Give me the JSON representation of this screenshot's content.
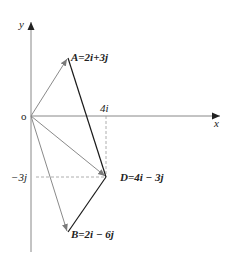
{
  "diagram": {
    "axes": {
      "x_label": "x",
      "y_label": "y",
      "origin_label": "o"
    },
    "ticks": {
      "x_tick_label": "4i",
      "y_tick_label": "−3j"
    },
    "points": {
      "A": {
        "name": "A",
        "expr": "=2i+3j"
      },
      "D": {
        "name": "D",
        "expr": "=4i − 3j"
      },
      "B": {
        "name": "B",
        "expr": "=2i − 6j"
      }
    },
    "vectors": [
      {
        "from": "O",
        "to": "A",
        "value": "2i+3j"
      },
      {
        "from": "O",
        "to": "D",
        "value": "4i−3j"
      },
      {
        "from": "O",
        "to": "B",
        "value": "2i−6j"
      }
    ],
    "segments": [
      {
        "from": "A",
        "to": "D"
      },
      {
        "from": "D",
        "to": "B"
      }
    ],
    "colors": {
      "axis": "#888888",
      "vector": "#8a8a8a",
      "segment": "#1a1a1a",
      "dashed": "#999999"
    }
  }
}
